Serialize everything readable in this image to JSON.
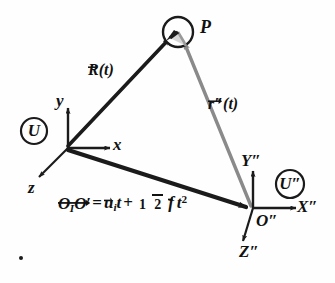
{
  "figure": {
    "type": "vector-diagram",
    "background_color": "#fefefe",
    "primary_color": "#1b1b1b",
    "secondary_color": "#8a8a8a"
  },
  "point": {
    "label": "P",
    "marker": "circle-open"
  },
  "frames": [
    {
      "id": "U",
      "badge": "U",
      "origin_label": "",
      "axes": [
        {
          "name": "y-axis",
          "label": "y",
          "direction": "up"
        },
        {
          "name": "x-axis",
          "label": "x",
          "direction": "right"
        },
        {
          "name": "z-axis",
          "label": "z",
          "direction": "down-left"
        }
      ]
    },
    {
      "id": "Upp",
      "badge": "U″",
      "origin_label": "O″",
      "axes": [
        {
          "name": "Y-axis",
          "label": "Y″",
          "direction": "up"
        },
        {
          "name": "X-axis",
          "label": "X″",
          "direction": "right"
        },
        {
          "name": "Z-axis",
          "label": "Z″",
          "direction": "down-left"
        }
      ]
    }
  ],
  "vectors": [
    {
      "id": "R",
      "base": "R",
      "args": "(t)",
      "arrow": true,
      "color": "#1b1b1b",
      "from": "O",
      "to": "P"
    },
    {
      "id": "rpp",
      "base": "r″",
      "args": "(t)",
      "arrow": true,
      "color": "#8a8a8a",
      "from": "O″",
      "to": "P"
    },
    {
      "id": "OO",
      "base": "O",
      "args": "",
      "arrow": true,
      "color": "#1b1b1b",
      "from": "O",
      "to": "O″"
    }
  ],
  "equation": {
    "lhs_first_letter": "O",
    "lhs_subscript": "I",
    "lhs_second_letter": "O′",
    "equals": "=",
    "term1_letter": "u",
    "term1_subscript": "i",
    "term1_time": "t",
    "plus": "+",
    "fraction_numerator": "1",
    "fraction_denominator": "2",
    "term2_letter": "f",
    "term2_time": "t",
    "term2_exponent": "2",
    "full_text": "O₁O′ = uᵢt + ½ f t²"
  },
  "labels": {
    "point_P": "P",
    "vector_R": "R",
    "vector_R_arg": "(t)",
    "vector_rpp": "r″",
    "vector_rpp_arg": "(t)",
    "badge_U": "U",
    "badge_Upp": "U″",
    "axis_y": "y",
    "axis_x": "x",
    "axis_z": "z",
    "axis_Ypp": "Y″",
    "axis_Xpp": "X″",
    "axis_Zpp": "Z″",
    "origin_Opp": "O″"
  }
}
